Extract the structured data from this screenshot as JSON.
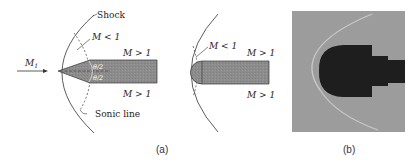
{
  "panel_a": {
    "caption": "(a)",
    "wedge": {
      "freestream_label": "M",
      "freestream_sub": "1",
      "shock_label": "Shock",
      "subsonic_label": "M < 1",
      "supersonic_upper": "M > 1",
      "supersonic_lower": "M > 1",
      "sonic_line_label": "Sonic line",
      "half_angle_upper": "θ/2",
      "half_angle_lower": "θ/2"
    },
    "blunt": {
      "subsonic_label": "M < 1",
      "supersonic_upper": "M > 1",
      "supersonic_lower": "M > 1"
    }
  },
  "panel_b": {
    "caption": "(b)"
  },
  "colors": {
    "body_fill": "#8a8a8a",
    "photo_bg": "#9a9a9a",
    "photo_body": "#1e1e1e",
    "line": "#333333"
  }
}
